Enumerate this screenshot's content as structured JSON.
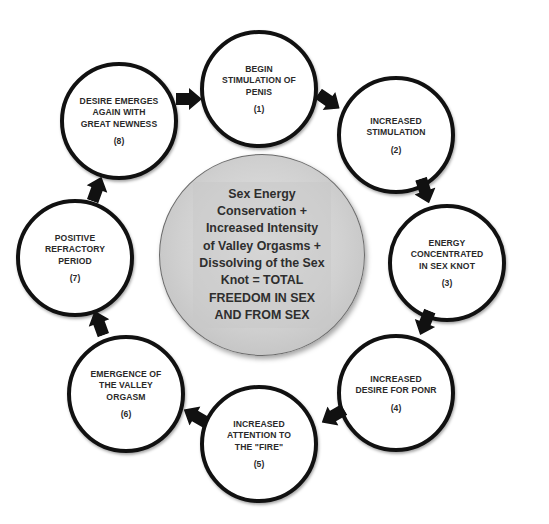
{
  "diagram": {
    "type": "cycle",
    "center": {
      "text": "Sex Energy\nConservation +\nIncreased Intensity\nof Valley Orgasms +\nDissolving of the Sex\nKnot = TOTAL\nFREEDOM IN SEX\nAND FROM SEX"
    },
    "steps": [
      {
        "label": "BEGIN\nSTIMULATION OF\nPENIS",
        "number": "(1)"
      },
      {
        "label": "INCREASED\nSTIMULATION",
        "number": "(2)"
      },
      {
        "label": "ENERGY\nCONCENTRATED\nIN SEX KNOT",
        "number": "(3)"
      },
      {
        "label": "INCREASED\nDESIRE FOR PONR",
        "number": "(4)"
      },
      {
        "label": "INCREASED\nATTENTION TO\nTHE \"FIRE\"",
        "number": "(5)"
      },
      {
        "label": "EMERGENCE OF\nTHE VALLEY\nORGASM",
        "number": "(6)"
      },
      {
        "label": "POSITIVE\nREFRACTORY\nPERIOD",
        "number": "(7)"
      },
      {
        "label": "DESIRE EMERGES\nAGAIN WITH\nGREAT NEWNESS",
        "number": "(8)"
      }
    ],
    "arrow_icon": "arrow-icon",
    "colors": {
      "border": "#111111",
      "center_fill": "#d0d0d0",
      "text": "#2a2a2a",
      "arrow": "#111111"
    }
  }
}
